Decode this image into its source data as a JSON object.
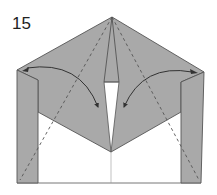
{
  "diagram": {
    "type": "origami-fold-step",
    "step_number": "15",
    "colors": {
      "paper_colored": "#a9a9a9",
      "paper_white": "#ffffff",
      "line": "#555555",
      "arrow": "#333333"
    },
    "elements": [
      {
        "name": "step-number",
        "text": "15"
      },
      {
        "name": "left-flap-arrow",
        "description": "curved arrow from left corner to center slit"
      },
      {
        "name": "right-flap-arrow",
        "description": "curved arrow from right corner to center slit"
      },
      {
        "name": "valley-fold-lines",
        "description": "dashed lines from apex down to bottom corners"
      },
      {
        "name": "center-slit",
        "description": "white slit opening in center"
      }
    ]
  }
}
